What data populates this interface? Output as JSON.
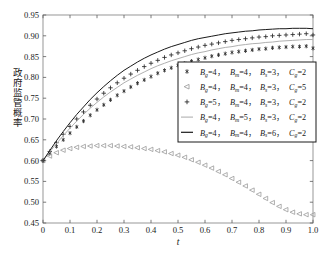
{
  "chart_data": {
    "type": "line",
    "title": "",
    "xlabel": "t",
    "ylabel": "政府监管概率",
    "xlim": [
      0,
      1.0
    ],
    "ylim": [
      0.45,
      0.95
    ],
    "xticks": [
      "0",
      "0.1",
      "0.2",
      "0.3",
      "0.4",
      "0.5",
      "0.6",
      "0.7",
      "0.8",
      "0.9",
      "1.0"
    ],
    "xtick_values": [
      0,
      0.1,
      0.2,
      0.3,
      0.4,
      0.5,
      0.6,
      0.7,
      0.8,
      0.9,
      1.0
    ],
    "yticks": [
      "0.45",
      "0.50",
      "0.55",
      "0.60",
      "0.65",
      "0.70",
      "0.75",
      "0.80",
      "0.85",
      "0.90",
      "0.95"
    ],
    "ytick_values": [
      0.45,
      0.5,
      0.55,
      0.6,
      0.65,
      0.7,
      0.75,
      0.8,
      0.85,
      0.9,
      0.95
    ],
    "grid": false,
    "legend_position": "center-right",
    "x": [
      0,
      0.025,
      0.05,
      0.075,
      0.1,
      0.125,
      0.15,
      0.175,
      0.2,
      0.225,
      0.25,
      0.275,
      0.3,
      0.325,
      0.35,
      0.375,
      0.4,
      0.425,
      0.45,
      0.475,
      0.5,
      0.525,
      0.55,
      0.575,
      0.6,
      0.625,
      0.65,
      0.675,
      0.7,
      0.725,
      0.75,
      0.775,
      0.8,
      0.825,
      0.85,
      0.875,
      0.9,
      0.925,
      0.95,
      0.975,
      1.0
    ],
    "series": [
      {
        "name": "series-star",
        "marker": "star",
        "color": "#2b2b2b",
        "legend": "Bg=4, Bm=4, Bs=3, Cg=2",
        "params": {
          "Bg": 4,
          "Bm": 4,
          "Bs": 3,
          "Cg": 2
        },
        "values": [
          0.6,
          0.617,
          0.634,
          0.65,
          0.666,
          0.681,
          0.695,
          0.709,
          0.722,
          0.734,
          0.746,
          0.757,
          0.767,
          0.777,
          0.786,
          0.794,
          0.802,
          0.81,
          0.817,
          0.823,
          0.829,
          0.834,
          0.839,
          0.843,
          0.847,
          0.851,
          0.854,
          0.857,
          0.86,
          0.862,
          0.864,
          0.866,
          0.868,
          0.869,
          0.871,
          0.872,
          0.873,
          0.874,
          0.874,
          0.875,
          0.87
        ]
      },
      {
        "name": "series-triangle-left",
        "marker": "triangle-left",
        "color": "#9a9a9a",
        "legend": "Bg=4, Bm=4, Bs=3, Cg=5",
        "params": {
          "Bg": 4,
          "Bm": 4,
          "Bs": 3,
          "Cg": 5
        },
        "values": [
          0.6,
          0.611,
          0.619,
          0.625,
          0.629,
          0.632,
          0.634,
          0.635,
          0.636,
          0.636,
          0.636,
          0.635,
          0.634,
          0.633,
          0.631,
          0.629,
          0.627,
          0.624,
          0.621,
          0.617,
          0.613,
          0.608,
          0.602,
          0.596,
          0.589,
          0.582,
          0.574,
          0.566,
          0.557,
          0.548,
          0.539,
          0.529,
          0.519,
          0.509,
          0.499,
          0.49,
          0.482,
          0.476,
          0.472,
          0.47,
          0.47
        ]
      },
      {
        "name": "series-plus",
        "marker": "plus",
        "color": "#2b2b2b",
        "legend": "Bg=5, Bm=4, Bs=3, Cg=2",
        "params": {
          "Bg": 5,
          "Bm": 4,
          "Bs": 3,
          "Cg": 2
        },
        "values": [
          0.6,
          0.622,
          0.643,
          0.663,
          0.682,
          0.7,
          0.717,
          0.733,
          0.748,
          0.762,
          0.775,
          0.787,
          0.798,
          0.808,
          0.817,
          0.826,
          0.834,
          0.841,
          0.848,
          0.854,
          0.859,
          0.864,
          0.869,
          0.873,
          0.877,
          0.88,
          0.883,
          0.886,
          0.889,
          0.891,
          0.893,
          0.895,
          0.897,
          0.898,
          0.9,
          0.901,
          0.902,
          0.903,
          0.904,
          0.905,
          0.902
        ]
      },
      {
        "name": "series-gray-line",
        "marker": "line",
        "color": "#b0b0b0",
        "legend": "Bg=4, Bm=5, Bs=3, Cg=2",
        "params": {
          "Bg": 4,
          "Bm": 5,
          "Bs": 3,
          "Cg": 2
        },
        "values": [
          0.6,
          0.621,
          0.641,
          0.66,
          0.678,
          0.695,
          0.711,
          0.726,
          0.74,
          0.753,
          0.765,
          0.776,
          0.787,
          0.796,
          0.805,
          0.813,
          0.821,
          0.828,
          0.834,
          0.84,
          0.845,
          0.85,
          0.855,
          0.859,
          0.862,
          0.866,
          0.869,
          0.872,
          0.874,
          0.877,
          0.879,
          0.881,
          0.882,
          0.884,
          0.885,
          0.887,
          0.888,
          0.889,
          0.89,
          0.891,
          0.891
        ]
      },
      {
        "name": "series-black-line",
        "marker": "line",
        "color": "#1a1a1a",
        "legend": "Bg=4, Bm=4, Bs=6, Cg=2",
        "params": {
          "Bg": 4,
          "Bm": 4,
          "Bs": 6,
          "Cg": 2
        },
        "values": [
          0.6,
          0.624,
          0.648,
          0.67,
          0.691,
          0.711,
          0.729,
          0.747,
          0.763,
          0.778,
          0.792,
          0.805,
          0.817,
          0.827,
          0.837,
          0.846,
          0.854,
          0.861,
          0.868,
          0.874,
          0.879,
          0.884,
          0.889,
          0.893,
          0.896,
          0.899,
          0.902,
          0.905,
          0.907,
          0.909,
          0.911,
          0.912,
          0.914,
          0.915,
          0.916,
          0.917,
          0.917,
          0.918,
          0.918,
          0.918,
          0.917
        ]
      }
    ]
  },
  "legend": {
    "entries": [
      {
        "marker": "star",
        "bg": "4",
        "bm": "4",
        "bs": "3",
        "cg": "2"
      },
      {
        "marker": "triangle-left",
        "bg": "4",
        "bm": "4",
        "bs": "3",
        "cg": "5"
      },
      {
        "marker": "plus",
        "bg": "5",
        "bm": "4",
        "bs": "3",
        "cg": "2"
      },
      {
        "marker": "gray-line",
        "bg": "4",
        "bm": "5",
        "bs": "3",
        "cg": "2"
      },
      {
        "marker": "black-line",
        "bg": "4",
        "bm": "4",
        "bs": "6",
        "cg": "2"
      }
    ],
    "symbols": {
      "B": "B",
      "C": "C",
      "eq": "=",
      "comma": "，"
    },
    "subscripts": {
      "g": "g",
      "m": "m",
      "s": "s"
    }
  },
  "axes": {
    "x_title": "t",
    "y_title": "政府监管概率"
  },
  "caption": ""
}
